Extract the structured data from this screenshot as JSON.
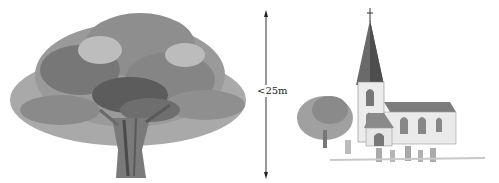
{
  "diagram": {
    "height_label": "<25m",
    "elements": [
      {
        "name": "large-tree",
        "description": "Broad watercolor tree with wide dense canopy"
      },
      {
        "name": "height-arrow",
        "description": "Vertical double-headed arrow indicating height"
      },
      {
        "name": "church",
        "description": "Church with tall spire, nave, and graveyard"
      },
      {
        "name": "small-tree",
        "description": "Small tree beside the church"
      }
    ],
    "colors": {
      "foliage_dark": "#555555",
      "foliage_mid": "#808080",
      "foliage_light": "#a8a8a8",
      "line": "#222222",
      "background": "#ffffff"
    }
  }
}
